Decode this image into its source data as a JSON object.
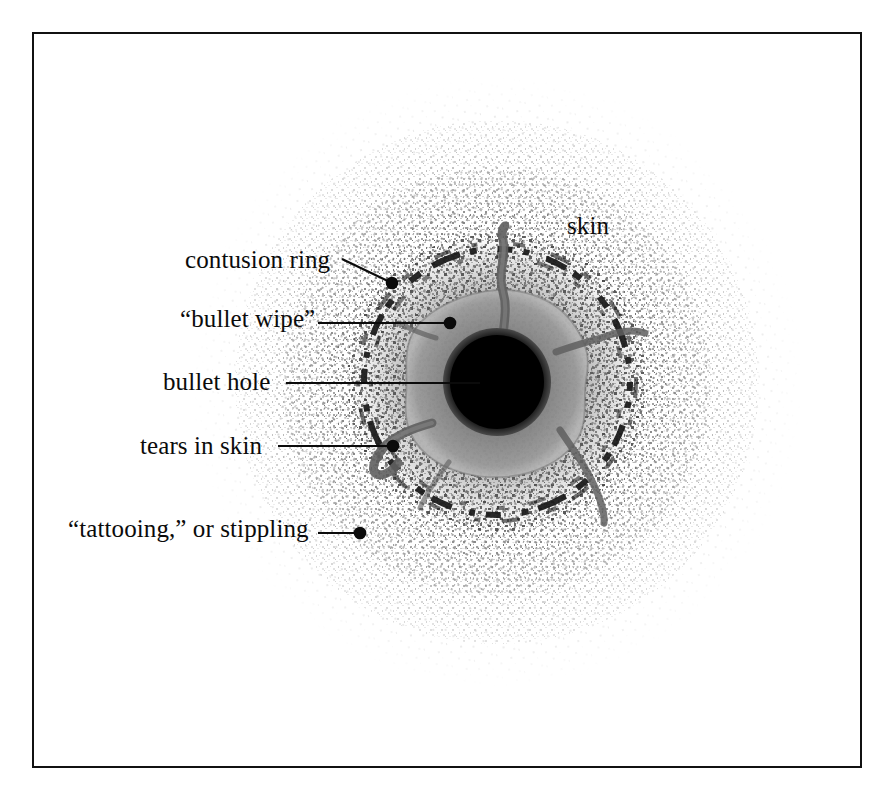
{
  "figure": {
    "kind": "forensic-illustration",
    "frame_color": "#111111",
    "background_color": "#ffffff"
  },
  "labels": [
    {
      "id": "contusion-ring",
      "text": "contusion ring"
    },
    {
      "id": "bullet-wipe",
      "text": "“bullet wipe”"
    },
    {
      "id": "bullet-hole",
      "text": "bullet hole"
    },
    {
      "id": "tears-in-skin",
      "text": "tears in skin"
    },
    {
      "id": "tattooing",
      "text": "“tattooing,” or stippling"
    },
    {
      "id": "skin",
      "text": "skin"
    }
  ],
  "leaders": [
    {
      "id": "contusion-ring",
      "from": [
        342,
        259
      ],
      "to": [
        392,
        283
      ],
      "dot": true
    },
    {
      "id": "bullet-wipe",
      "from": [
        318,
        323
      ],
      "to": [
        450,
        323
      ],
      "dot": true
    },
    {
      "id": "bullet-hole",
      "from": [
        286,
        383
      ],
      "to": [
        470,
        383
      ],
      "dot": false
    },
    {
      "id": "tears-in-skin",
      "from": [
        278,
        446
      ],
      "to": [
        393,
        446
      ],
      "dot": true
    },
    {
      "id": "tattooing",
      "from": [
        318,
        533
      ],
      "to": [
        360,
        533
      ],
      "dot": true
    }
  ],
  "anatomy": {
    "center": [
      497,
      382
    ],
    "bullet_hole_radius": 52,
    "bullet_wipe_radius": 88,
    "contusion_ring_radius": 132,
    "stipple_inner_radius": 95,
    "stipple_outer_radius": 305,
    "colors": {
      "bullet_hole": "#050505",
      "bullet_wipe": "#8a8a8a",
      "contusion_ring": "#1d1d1d",
      "tear": "#6b6b6b",
      "stipple_dark": "#2a2a2a",
      "stipple_mid": "#8f8f8f",
      "stipple_light": "#c8c8c8",
      "label_text": "#0b0b0b",
      "leader_line": "#0b0b0b"
    }
  }
}
